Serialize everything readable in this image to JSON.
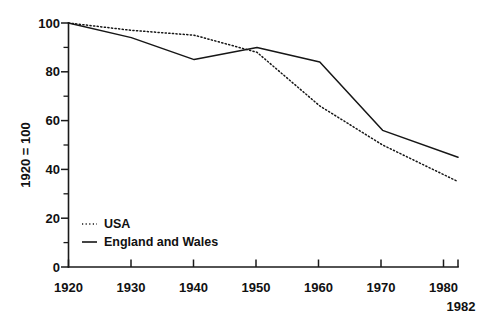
{
  "chart_data": {
    "type": "line",
    "title": "",
    "xlabel": "",
    "ylabel": "1920 = 100",
    "xlim": [
      1920,
      1982
    ],
    "ylim": [
      0,
      100
    ],
    "grid": false,
    "legend_position": "lower-left-inside",
    "x": [
      1920,
      1930,
      1940,
      1950,
      1960,
      1970,
      1982
    ],
    "xtick_labels": [
      "1920",
      "1930",
      "1940",
      "1950",
      "1960",
      "1970",
      "1980"
    ],
    "xticks": [
      1920,
      1930,
      1940,
      1950,
      1960,
      1970,
      1980
    ],
    "ytick_labels": [
      "0",
      "20",
      "40",
      "60",
      "80",
      "100"
    ],
    "yticks": [
      0,
      20,
      40,
      60,
      80,
      100
    ],
    "yminor_ticks": [
      10,
      30,
      50,
      70,
      90
    ],
    "axis_end_label": "1982",
    "series": [
      {
        "name": "USA",
        "style": "dotted",
        "values": [
          100,
          97,
          95,
          88,
          66,
          50,
          35
        ]
      },
      {
        "name": "England and Wales",
        "style": "solid",
        "values": [
          100,
          94,
          85,
          90,
          84,
          56,
          45
        ]
      }
    ]
  },
  "axis": {
    "y_title": "1920 = 100",
    "x_end_label": "1982"
  },
  "legend": {
    "entries": [
      {
        "label": "USA",
        "style": "dotted"
      },
      {
        "label": "England and Wales",
        "style": "solid"
      }
    ]
  },
  "ticks": {
    "y": [
      {
        "label": "100",
        "value": 100
      },
      {
        "label": "80",
        "value": 80
      },
      {
        "label": "60",
        "value": 60
      },
      {
        "label": "40",
        "value": 40
      },
      {
        "label": "20",
        "value": 20
      },
      {
        "label": "0",
        "value": 0
      }
    ],
    "x": [
      {
        "label": "1920",
        "value": 1920
      },
      {
        "label": "1930",
        "value": 1930
      },
      {
        "label": "1940",
        "value": 1940
      },
      {
        "label": "1950",
        "value": 1950
      },
      {
        "label": "1960",
        "value": 1960
      },
      {
        "label": "1970",
        "value": 1970
      },
      {
        "label": "1980",
        "value": 1980
      }
    ]
  }
}
